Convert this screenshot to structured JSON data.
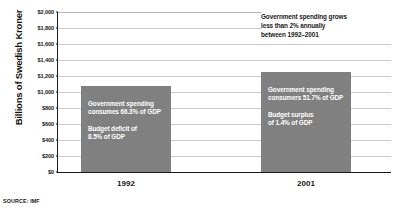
{
  "source_note": "SOURCE: IMF",
  "annotation_note": [
    "Government spending grows",
    "less than 2% annually",
    "between 1992–2001"
  ],
  "chart_data": {
    "type": "bar",
    "title": "",
    "xlabel": "",
    "ylabel": "Billions of Swedish Kroner",
    "categories": [
      "1992",
      "2001"
    ],
    "values": [
      1075,
      1250
    ],
    "ylim": [
      0,
      2000
    ],
    "ytick_values": [
      0,
      200,
      400,
      600,
      800,
      1000,
      1200,
      1400,
      1600,
      1800,
      2000
    ],
    "ytick_labels": [
      "$0",
      "$200",
      "$400",
      "$600",
      "$800",
      "$1,000",
      "$1,200",
      "$1,400",
      "$1,600",
      "$1,800",
      "$2,000"
    ],
    "grid": true,
    "legend": false,
    "bar_color": "#808080",
    "axis_color": "#1a1a1a",
    "grid_color": "#c8c8c8",
    "bar_labels": [
      {
        "category": "1992",
        "lines_primary": [
          "Government spending",
          "consumes 66.3% of GDP"
        ],
        "lines_secondary": [
          "Budget deficit of",
          "8.5% of GDP"
        ]
      },
      {
        "category": "2001",
        "lines_primary": [
          "Government spending",
          "consumers 51.7% of GDP"
        ],
        "lines_secondary": [
          "Budget surplus",
          "of 1.4% of GDP"
        ]
      }
    ]
  }
}
